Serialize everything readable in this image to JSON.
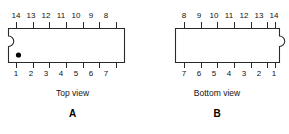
{
  "figures": [
    {
      "id": "A",
      "letter": "A",
      "caption": "Top view",
      "top_pins": [
        "14",
        "13",
        "12",
        "11",
        "10",
        "9",
        "8"
      ],
      "bottom_pins": [
        "1",
        "2",
        "3",
        "4",
        "5",
        "6",
        "7"
      ],
      "notch_side": "left",
      "has_pin1_dot": true
    },
    {
      "id": "B",
      "letter": "B",
      "caption": "Bottom view",
      "top_pins": [
        "8",
        "9",
        "10",
        "11",
        "12",
        "13",
        "14"
      ],
      "bottom_pins": [
        "7",
        "6",
        "5",
        "4",
        "3",
        "2",
        "1"
      ],
      "notch_side": "right",
      "has_pin1_dot": false
    }
  ],
  "style": {
    "line_color": "#2a2a2a",
    "body_fill": "#ffffff",
    "dot_color": "#000000",
    "background": "#ffffff"
  }
}
